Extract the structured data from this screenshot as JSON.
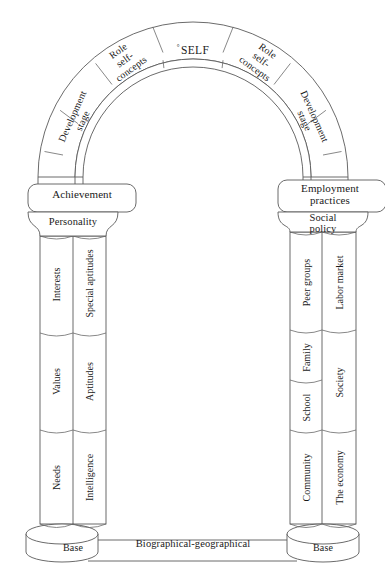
{
  "diagram": {
    "type": "archway",
    "colors": {
      "stroke": "#5a5a5a",
      "text": "#1a1a1a",
      "background": "#ffffff"
    }
  },
  "arch": {
    "keystone": {
      "label": "SELF",
      "marker": "°"
    },
    "segments_left": [
      {
        "name": "role-self-concepts",
        "label": "Role\nself-\nconcepts"
      },
      {
        "name": "development-stage",
        "label": "Development\nstage"
      }
    ],
    "segments_right": [
      {
        "name": "role-self-concepts",
        "label": "Role\nself-\nconcepts"
      },
      {
        "name": "development-stage",
        "label": "Development\nstage"
      }
    ],
    "role_line1": "Role",
    "role_line2": "self-",
    "role_line3": "concepts",
    "dev_line1": "Development",
    "dev_line2": "stage"
  },
  "left_pillar": {
    "capital": "Achievement",
    "subcapital": "Personality",
    "base": "Base",
    "outer_column": [
      {
        "label": "Interests"
      },
      {
        "label": "Values"
      },
      {
        "label": "Needs"
      }
    ],
    "inner_column": [
      {
        "label": "Special aptitudes"
      },
      {
        "label": "Aptitudes"
      },
      {
        "label": "Intelligence"
      }
    ]
  },
  "right_pillar": {
    "capital_line1": "Employment",
    "capital_line2": "practices",
    "subcapital_line1": "Social",
    "subcapital_line2": "policy",
    "base": "Base",
    "inner_column": [
      {
        "label": "Peer groups"
      },
      {
        "label": "Family"
      },
      {
        "label": "School"
      },
      {
        "label": "Community"
      }
    ],
    "outer_column": [
      {
        "label": "Labor market"
      },
      {
        "label": "Society"
      },
      {
        "label": "The economy"
      }
    ]
  },
  "footer": {
    "span_label": "Biographical-geographical"
  }
}
